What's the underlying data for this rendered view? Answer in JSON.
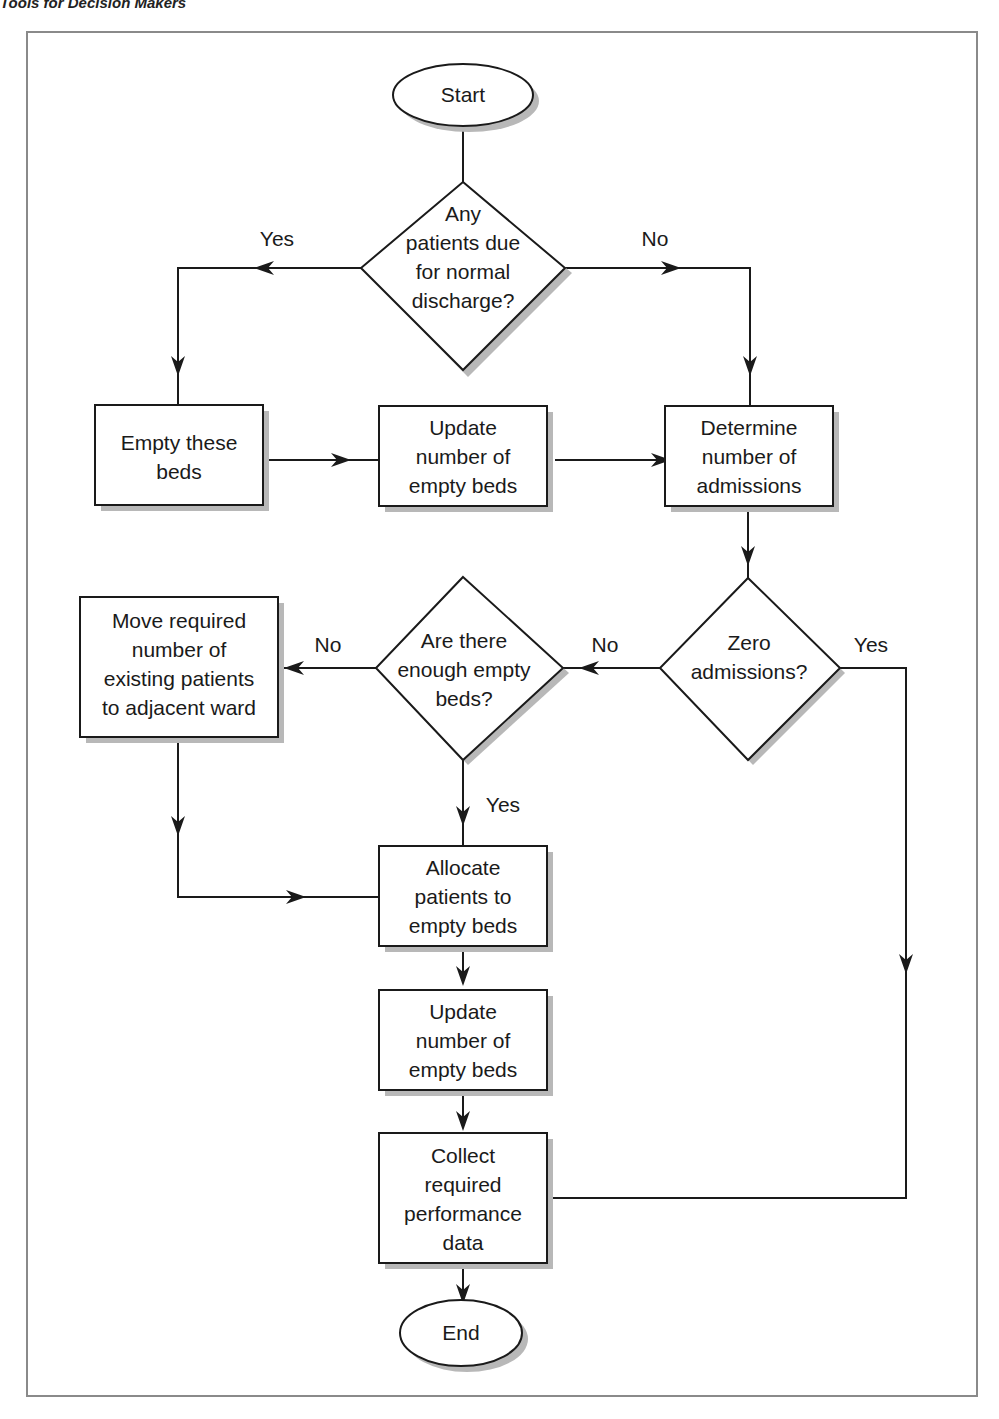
{
  "page": {
    "header": "Tools for Decision Makers"
  },
  "colors": {
    "line": "#1a1a1a",
    "shadow": "#b8b8b8",
    "frame": "#8a8a8a",
    "background": "#ffffff"
  },
  "flowchart": {
    "nodes": {
      "start": {
        "type": "terminator",
        "lines": [
          "Start"
        ]
      },
      "q_discharge": {
        "type": "decision",
        "lines": [
          "Any",
          "patients due",
          "for normal",
          "discharge?"
        ]
      },
      "empty_beds": {
        "type": "process",
        "lines": [
          "Empty these",
          "beds"
        ]
      },
      "update_empty_1": {
        "type": "process",
        "lines": [
          "Update",
          "number of",
          "empty beds"
        ]
      },
      "determine_admissions": {
        "type": "process",
        "lines": [
          "Determine",
          "number of",
          "admissions"
        ]
      },
      "q_zero": {
        "type": "decision",
        "lines": [
          "Zero",
          "admissions?"
        ]
      },
      "q_enough": {
        "type": "decision",
        "lines": [
          "Are there",
          "enough empty",
          "beds?"
        ]
      },
      "move_patients": {
        "type": "process",
        "lines": [
          "Move required",
          "number of",
          "existing patients",
          "to adjacent ward"
        ]
      },
      "allocate": {
        "type": "process",
        "lines": [
          "Allocate",
          "patients to",
          "empty beds"
        ]
      },
      "update_empty_2": {
        "type": "process",
        "lines": [
          "Update",
          "number of",
          "empty beds"
        ]
      },
      "collect": {
        "type": "process",
        "lines": [
          "Collect",
          "required",
          "performance",
          "data"
        ]
      },
      "end": {
        "type": "terminator",
        "lines": [
          "End"
        ]
      }
    },
    "edge_labels": {
      "discharge_yes": "Yes",
      "discharge_no": "No",
      "enough_no": "No",
      "zero_no": "No",
      "zero_yes": "Yes",
      "enough_yes": "Yes"
    }
  }
}
